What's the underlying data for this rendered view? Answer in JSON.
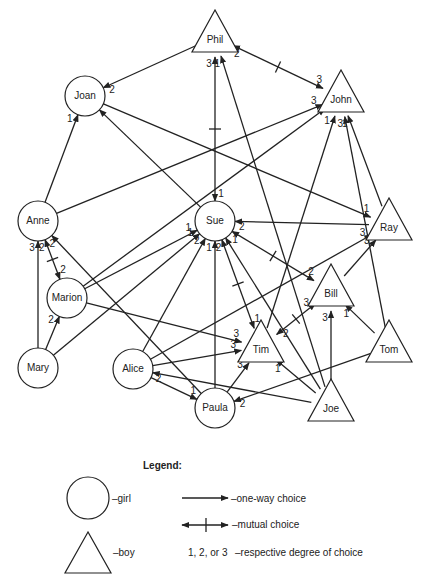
{
  "diagram": {
    "type": "sociogram",
    "nodes": [
      {
        "id": "Phil",
        "label": "Phil",
        "gender": "boy",
        "x": 215,
        "y": 37
      },
      {
        "id": "Joan",
        "label": "Joan",
        "gender": "girl",
        "x": 85,
        "y": 96
      },
      {
        "id": "John",
        "label": "John",
        "gender": "boy",
        "x": 341,
        "y": 97
      },
      {
        "id": "Anne",
        "label": "Anne",
        "gender": "girl",
        "x": 38,
        "y": 221
      },
      {
        "id": "Sue",
        "label": "Sue",
        "gender": "girl",
        "x": 215,
        "y": 221
      },
      {
        "id": "Ray",
        "label": "Ray",
        "gender": "boy",
        "x": 389,
        "y": 225
      },
      {
        "id": "Marion",
        "label": "Marion",
        "gender": "girl",
        "x": 67,
        "y": 298
      },
      {
        "id": "Bill",
        "label": "Bill",
        "gender": "boy",
        "x": 331,
        "y": 291
      },
      {
        "id": "Tim",
        "label": "Tim",
        "gender": "boy",
        "x": 261,
        "y": 347
      },
      {
        "id": "Tom",
        "label": "Tom",
        "gender": "boy",
        "x": 389,
        "y": 347
      },
      {
        "id": "Mary",
        "label": "Mary",
        "gender": "girl",
        "x": 38,
        "y": 368
      },
      {
        "id": "Alice",
        "label": "Alice",
        "gender": "girl",
        "x": 133,
        "y": 369
      },
      {
        "id": "Paula",
        "label": "Paula",
        "gender": "girl",
        "x": 215,
        "y": 408
      },
      {
        "id": "Joe",
        "label": "Joe",
        "gender": "boy",
        "x": 331,
        "y": 406
      }
    ],
    "edges": [
      {
        "from": "Phil",
        "to": "Joan",
        "degree": "2",
        "mutual": false
      },
      {
        "from": "Phil",
        "to": "John",
        "degree": "3",
        "mutual": true,
        "degree_to": "2"
      },
      {
        "from": "Sue",
        "to": "Phil",
        "degree": "3",
        "mutual": true,
        "degree_to": "1"
      },
      {
        "from": "Anne",
        "to": "Joan",
        "degree": "1",
        "mutual": false
      },
      {
        "from": "Anne",
        "to": "John",
        "degree": "3",
        "mutual": false
      },
      {
        "from": "Sue",
        "to": "Joan",
        "degree": "",
        "mutual": false
      },
      {
        "from": "Marion",
        "to": "John",
        "degree": "",
        "mutual": false
      },
      {
        "from": "Ray",
        "to": "John",
        "degree": "1",
        "mutual": false
      },
      {
        "from": "Tim",
        "to": "John",
        "degree": "1",
        "mutual": false
      },
      {
        "from": "Joe",
        "to": "Phil",
        "degree": "1",
        "mutual": false
      },
      {
        "from": "Ray",
        "to": "Sue",
        "degree": "2",
        "mutual": false
      },
      {
        "from": "Joan",
        "to": "Ray",
        "degree": "1",
        "mutual": false
      },
      {
        "from": "Alice",
        "to": "Ray",
        "degree": "3",
        "mutual": false
      },
      {
        "from": "Sue",
        "to": "Bill",
        "degree": "2",
        "mutual": true,
        "degree_to": "1"
      },
      {
        "from": "Bill",
        "to": "Ray",
        "degree": "3",
        "mutual": false
      },
      {
        "from": "Anne",
        "to": "Marion",
        "degree": "2",
        "mutual": true,
        "degree_to": "2"
      },
      {
        "from": "Marion",
        "to": "Sue",
        "degree": "1",
        "mutual": false
      },
      {
        "from": "Marion",
        "to": "Tim",
        "degree": "3",
        "mutual": false
      },
      {
        "from": "Mary",
        "to": "Anne",
        "degree": "3",
        "mutual": false
      },
      {
        "from": "Mary",
        "to": "Marion",
        "degree": "2",
        "mutual": false
      },
      {
        "from": "Mary",
        "to": "Sue",
        "degree": "1",
        "mutual": false
      },
      {
        "from": "Alice",
        "to": "Sue",
        "degree": "2",
        "mutual": false
      },
      {
        "from": "Alice",
        "to": "Tim",
        "degree": "3",
        "mutual": false
      },
      {
        "from": "Alice",
        "to": "Paula",
        "degree": "1",
        "mutual": false
      },
      {
        "from": "Paula",
        "to": "Anne",
        "degree": "2",
        "mutual": false
      },
      {
        "from": "Paula",
        "to": "Sue",
        "degree": "1",
        "mutual": false
      },
      {
        "from": "Paula",
        "to": "Tim",
        "degree": "3",
        "mutual": false
      },
      {
        "from": "Tim",
        "to": "Sue",
        "degree": "2",
        "mutual": true,
        "degree_to": "1"
      },
      {
        "from": "Tim",
        "to": "Bill",
        "degree": "3",
        "mutual": true,
        "degree_to": "2"
      },
      {
        "from": "Joe",
        "to": "Sue",
        "degree": "",
        "mutual": false
      },
      {
        "from": "Joe",
        "to": "Bill",
        "degree": "3",
        "mutual": false
      },
      {
        "from": "Joe",
        "to": "Alice",
        "degree": "2",
        "mutual": false
      },
      {
        "from": "Tom",
        "to": "Bill",
        "degree": "1",
        "mutual": false
      },
      {
        "from": "Tom",
        "to": "Paula",
        "degree": "2",
        "mutual": false
      },
      {
        "from": "Tom",
        "to": "John",
        "degree": "3",
        "mutual": false
      },
      {
        "from": "Joe",
        "to": "Tim",
        "degree": "1",
        "mutual": false
      }
    ]
  },
  "legend": {
    "title": "Legend:",
    "girl_label": "–girl",
    "boy_label": "–boy",
    "one_way_label": "–one-way choice",
    "mutual_label": "–mutual choice",
    "degrees_key": "1, 2, or 3",
    "degrees_label": "–respective degree of choice"
  }
}
